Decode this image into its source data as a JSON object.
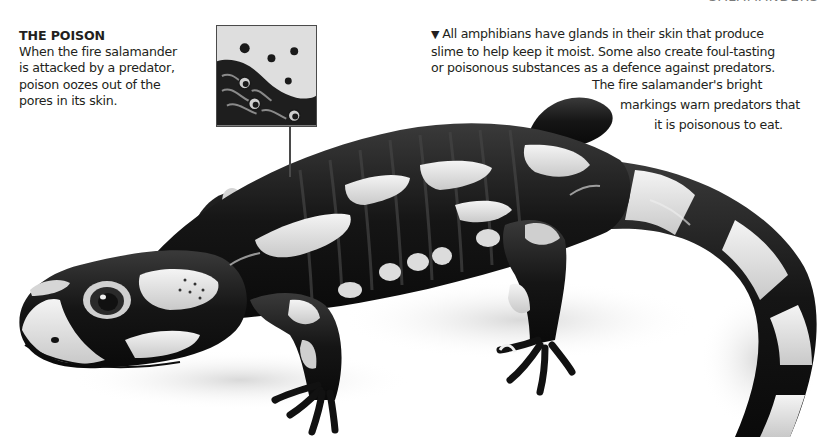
{
  "page": {
    "clipped_header_text": "SALAMANDERS"
  },
  "poison_callout": {
    "title": "THE POISON",
    "lines": [
      "When the fire salamander",
      "is attacked by a predator,",
      "poison oozes out of the",
      "pores in its skin."
    ],
    "inset_image_description": "close-up of salamander skin with poison droplets oozing from pores"
  },
  "intro_text": {
    "marker": "▼",
    "lines": [
      "All amphibians have glands in their skin that produce",
      "slime to help keep it moist. Some also create foul-tasting",
      "or poisonous substances as a defence against predators."
    ]
  },
  "caption": {
    "lines": [
      "The fire salamander's bright",
      "markings warn predators that",
      "it is poisonous to eat."
    ]
  },
  "illustration": {
    "subject": "fire salamander",
    "style": "grayscale illustration",
    "colors": {
      "body_dark": "#1a1a1a",
      "markings_light": "#e6e6e6",
      "shadow": "#d9d9d9",
      "outline": "#0d0d0d"
    }
  }
}
